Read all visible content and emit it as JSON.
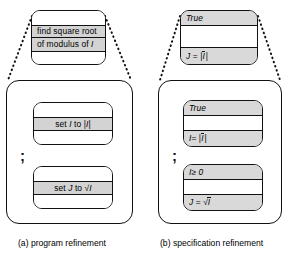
{
  "figure": {
    "panels": [
      {
        "id": "program-refinement",
        "caption": "(a) program refinement",
        "abstract_box": {
          "bands": [
            {
              "kind": "blank",
              "text": ""
            },
            {
              "kind": "shaded",
              "text": "find square root"
            },
            {
              "kind": "shaded",
              "text": "of modulus of I"
            },
            {
              "kind": "blank",
              "text": ""
            }
          ]
        },
        "refined_boxes": [
          {
            "bands": [
              {
                "kind": "blank",
                "text": ""
              },
              {
                "kind": "shaded",
                "text": "set I to |I|"
              },
              {
                "kind": "blank",
                "text": ""
              }
            ]
          },
          {
            "bands": [
              {
                "kind": "blank",
                "text": ""
              },
              {
                "kind": "shaded",
                "text": "set J to √I"
              },
              {
                "kind": "blank",
                "text": ""
              }
            ]
          }
        ],
        "separator": ";"
      },
      {
        "id": "specification-refinement",
        "caption": "(b) specification refinement",
        "abstract_box": {
          "bands": [
            {
              "kind": "shaded",
              "text": "True"
            },
            {
              "kind": "blank",
              "text": ""
            },
            {
              "kind": "shaded",
              "text": "J = |Ī|"
            }
          ]
        },
        "refined_boxes": [
          {
            "bands": [
              {
                "kind": "shaded",
                "text": "True"
              },
              {
                "kind": "blank",
                "text": ""
              },
              {
                "kind": "shaded",
                "text": "I = |Ī|"
              }
            ]
          },
          {
            "bands": [
              {
                "kind": "shaded",
                "text": "I ≥ 0"
              },
              {
                "kind": "blank",
                "text": ""
              },
              {
                "kind": "shaded",
                "text": "J = √Ī"
              }
            ]
          }
        ],
        "separator": ";"
      }
    ],
    "colors": {
      "shade": "#d3d3d3",
      "line": "#111111",
      "background": "#ffffff"
    }
  }
}
